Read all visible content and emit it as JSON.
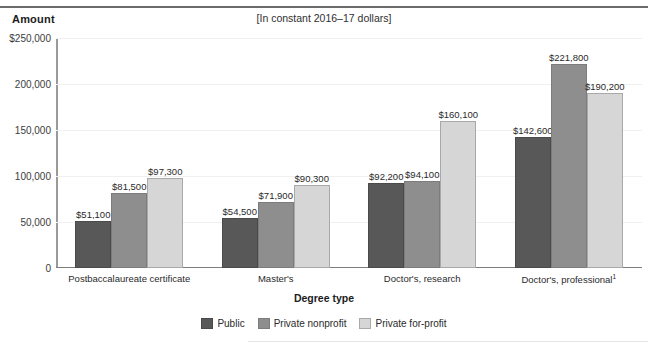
{
  "subtitle": "[In constant 2016–17 dollars]",
  "y_axis_title": "Amount",
  "x_axis_title": "Degree type",
  "colors": {
    "public": "#585858",
    "private_nonprofit": "#8e8e8e",
    "private_for_profit": "#d6d6d6",
    "axis": "#7d7d7d",
    "grid": "#f0f0f0"
  },
  "chart_data": {
    "type": "bar",
    "title": "",
    "subtitle": "[In constant 2016–17 dollars]",
    "xlabel": "Degree type",
    "ylabel": "Amount",
    "ylim": [
      0,
      250000
    ],
    "grid": true,
    "legend_position": "bottom",
    "categories": [
      "Postbaccalaureate certificate",
      "Master's",
      "Doctor's, research",
      "Doctor's, professional"
    ],
    "category_footnotes": [
      "",
      "",
      "",
      "1"
    ],
    "ytick_labels": [
      "$250,000",
      "200,000",
      "150,000",
      "100,000",
      "50,000",
      "0"
    ],
    "ytick_values": [
      250000,
      200000,
      150000,
      100000,
      50000,
      0
    ],
    "series": [
      {
        "name": "Public",
        "values": [
          51100,
          54500,
          92200,
          142600
        ],
        "labels": [
          "$51,100",
          "$54,500",
          "$92,200",
          "$142,600"
        ]
      },
      {
        "name": "Private nonprofit",
        "values": [
          81500,
          71900,
          94100,
          221800
        ],
        "labels": [
          "$81,500",
          "$71,900",
          "$94,100",
          "$221,800"
        ]
      },
      {
        "name": "Private for-profit",
        "values": [
          97300,
          90300,
          160100,
          190200
        ],
        "labels": [
          "$97,300",
          "$90,300",
          "$160,100",
          "$190,200"
        ]
      }
    ]
  }
}
